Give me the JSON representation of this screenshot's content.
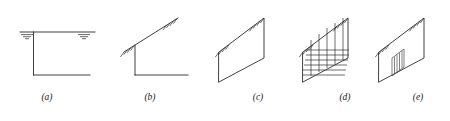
{
  "figure": {
    "kind": "engineering-line-diagram",
    "panel_count": 5,
    "stroke_color": "#2b2b2b",
    "background_color": "#ffffff",
    "panels": [
      {
        "id": "a",
        "caption": "(a)",
        "caption_x": 47,
        "caption_y": 100,
        "type": "horizontal-slab-two-supports",
        "support_symbol": "ground-hatch-stack",
        "support_count": 2,
        "notes": "Horizontal top member with two stacked-line ground supports; vertical stem with horizontal foot forming an L"
      },
      {
        "id": "b",
        "caption": "(b)",
        "caption_x": 150,
        "caption_y": 100,
        "type": "inclined-member-hatched-both-ends",
        "support_symbol": "diagonal-hatch",
        "support_count": 2,
        "notes": "Inclined line hatched at lower-left and upper-right ends; vertical stem with horizontal foot"
      },
      {
        "id": "c",
        "caption": "(c)",
        "caption_x": 258,
        "caption_y": 100,
        "type": "parallelogram-plain",
        "support_symbol": "diagonal-hatch",
        "support_count": 2,
        "notes": "Parallelogram panel, hatching on inclined top edge at both ends, no internal reinforcement"
      },
      {
        "id": "d",
        "caption": "(d)",
        "caption_x": 345,
        "caption_y": 100,
        "type": "parallelogram-full-grid",
        "support_symbol": "diagonal-hatch",
        "support_count": 2,
        "internal_pattern": "orthogonal-grid",
        "grid_vertical_lines": 5,
        "grid_horizontal_lines": 6,
        "notes": "Parallelogram panel with dense vertical and horizontal reinforcement grid across full face"
      },
      {
        "id": "e",
        "caption": "(e)",
        "caption_x": 418,
        "caption_y": 100,
        "type": "parallelogram-central-insert",
        "support_symbol": "diagonal-hatch",
        "support_count": 2,
        "internal_pattern": "small-central-vertical-bundle",
        "insert_vertical_lines": 4,
        "notes": "Parallelogram panel with a small central rectangular insert containing short vertical lines"
      }
    ]
  }
}
